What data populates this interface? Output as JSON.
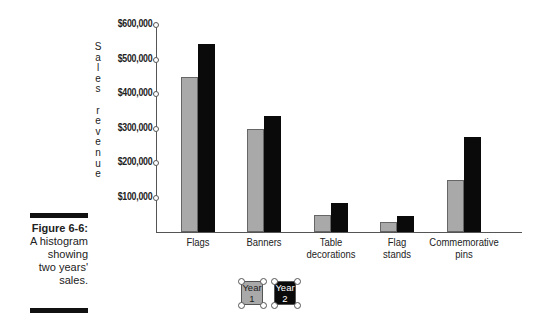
{
  "figure": {
    "number": "Figure 6-6:",
    "caption_lines": [
      "A histogram",
      "showing",
      "two years'",
      "sales."
    ]
  },
  "colors": {
    "year1": "#a9a9a9",
    "year2": "#0a0a0a",
    "axis": "#555555"
  },
  "chart_data": {
    "type": "bar",
    "title": "",
    "xlabel": "",
    "ylabel": "Sales revenue",
    "ylim": [
      0,
      600000
    ],
    "yticks": [
      100000,
      200000,
      300000,
      400000,
      500000,
      600000
    ],
    "ytick_labels": [
      "$100,000",
      "$200,000",
      "$300,000",
      "$400,000",
      "$500,000",
      "$600,000"
    ],
    "categories": [
      "Flags",
      "Banners",
      "Table decorations",
      "Flag stands",
      "Commemorative pins"
    ],
    "category_label_lines": [
      [
        "Flags"
      ],
      [
        "Banners"
      ],
      [
        "Table",
        "decorations"
      ],
      [
        "Flag",
        "stands"
      ],
      [
        "Commemorative",
        "pins"
      ]
    ],
    "series": [
      {
        "name": "Year 1",
        "values": [
          450000,
          300000,
          50000,
          30000,
          150000
        ]
      },
      {
        "name": "Year 2",
        "values": [
          545000,
          335000,
          85000,
          45000,
          275000
        ]
      }
    ],
    "legend": {
      "position": "bottom",
      "entries": [
        [
          "Year",
          "1"
        ],
        [
          "Year",
          "2"
        ]
      ]
    },
    "grid": false
  },
  "ylabel_letters": [
    "S",
    "a",
    "l",
    "e",
    "s",
    " ",
    "r",
    "e",
    "v",
    "e",
    "n",
    "u",
    "e"
  ]
}
